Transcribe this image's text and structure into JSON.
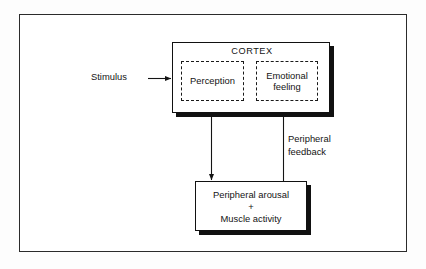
{
  "figure": {
    "type": "flow-diagram",
    "title_in_image": "",
    "background_color": "#ffffff",
    "frame_color": "#2b2b2b",
    "box_border_color": "#111111",
    "shadow_color": "#111111",
    "text_color": "#141414"
  },
  "cortex": {
    "label": "CORTEX",
    "sub_boxes": [
      {
        "id": "perception",
        "label": "Perception",
        "style": "dashed"
      },
      {
        "id": "emotional-feeling",
        "label": "Emotional\nfeeling",
        "style": "dashed"
      }
    ]
  },
  "arousal": {
    "line1": "Peripheral arousal",
    "operator": "+",
    "line2": "Muscle activity"
  },
  "labels": {
    "stimulus": "Stimulus",
    "peripheral_feedback": "Peripheral\nfeedback"
  },
  "connections": [
    {
      "id": "stimulus-to-cortex",
      "from": "Stimulus",
      "to": "CORTEX",
      "direction": "right"
    },
    {
      "id": "perception-to-arousal",
      "from": "Perception",
      "to": "Peripheral arousal + Muscle activity",
      "direction": "down"
    },
    {
      "id": "arousal-to-emotional",
      "from": "Peripheral arousal + Muscle activity",
      "to": "Emotional feeling",
      "direction": "up",
      "label": "Peripheral feedback"
    }
  ]
}
